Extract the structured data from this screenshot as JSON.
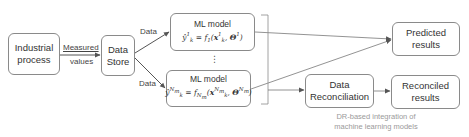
{
  "diagram": {
    "nodes": {
      "industrial_process": {
        "lines": [
          "Industrial",
          "process"
        ]
      },
      "data_store": {
        "lines": [
          "Data",
          "Store"
        ]
      },
      "ml_model_1": {
        "title": "ML model",
        "formula": "ŷ¹ₖ = f₁(x¹ₖ, Θ¹)"
      },
      "ml_model_n": {
        "title": "ML model",
        "formula": "ŷₖ^Nm = f_Nm(xₖ^Nm, Θ^Nm)"
      },
      "ellipsis": "⋮",
      "predicted_results": {
        "lines": [
          "Predicted",
          "results"
        ]
      },
      "data_reconciliation": {
        "lines": [
          "Data",
          "Reconciliation"
        ]
      },
      "reconciled_results": {
        "lines": [
          "Reconciled",
          "results"
        ]
      }
    },
    "edge_labels": {
      "measured": "Measured",
      "values": "values",
      "data_top": "Data",
      "data_bottom": "Data"
    },
    "caption": {
      "line1": "DR-based integration of",
      "line2": "machine learning models"
    },
    "edges": [
      {
        "from": "industrial_process",
        "to": "data_store",
        "label": "Measured values"
      },
      {
        "from": "data_store",
        "to": "ml_model_1",
        "label": "Data"
      },
      {
        "from": "data_store",
        "to": "ml_model_n",
        "label": "Data"
      },
      {
        "from": "ml_model_1",
        "to": "predicted_results"
      },
      {
        "from": "ml_model_n",
        "to": "predicted_results"
      },
      {
        "from": "ml_models_group",
        "to": "data_reconciliation"
      },
      {
        "from": "data_reconciliation",
        "to": "reconciled_results"
      }
    ],
    "colors": {
      "box_border": "#8a8a8a",
      "arrow": "#555555",
      "caption": "#9a9a9a",
      "text": "#333333"
    }
  }
}
